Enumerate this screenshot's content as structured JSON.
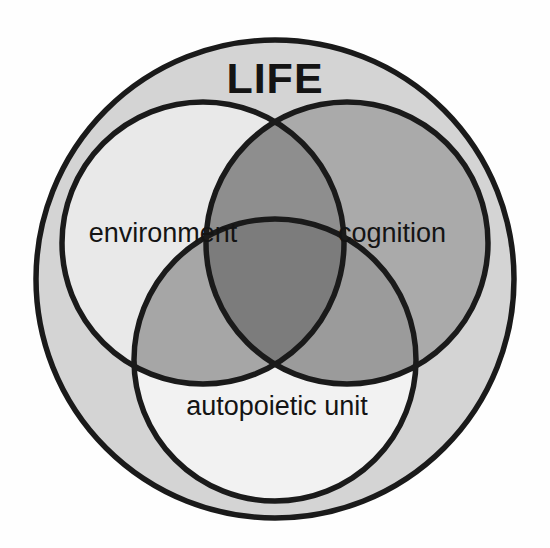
{
  "figure": {
    "type": "venn-diagram",
    "title": "LIFE",
    "background_color": "#fefefe",
    "outline_color": "#1a1a1a",
    "universe": {
      "name": "LIFE",
      "label": "LIFE",
      "fill": "#d4d4d4",
      "cx": 275,
      "cy": 279,
      "r": 239
    },
    "sets": [
      {
        "key": "environment",
        "label": "environment",
        "fill": "#e9e9e9",
        "cx": 203,
        "cy": 243,
        "r": 141,
        "label_x": 163,
        "label_y": 235
      },
      {
        "key": "cognition",
        "label": "cognition",
        "fill": "#aaaaaa",
        "cx": 347,
        "cy": 243,
        "r": 141,
        "label_x": 392,
        "label_y": 235
      },
      {
        "key": "autopoietic_unit",
        "label": "autopoietic unit",
        "fill": "#f2f2f2",
        "cx": 275,
        "cy": 360,
        "r": 141,
        "label_x": 277,
        "label_y": 408
      }
    ],
    "intersections": [
      {
        "key": "environment-cognition",
        "label": "environment ∩ cognition",
        "fill": "#8e8e8e"
      },
      {
        "key": "environment-autopoietic_unit",
        "label": "environment ∩ autopoietic unit",
        "fill": "#a6a6a6"
      },
      {
        "key": "cognition-autopoietic_unit",
        "label": "cognition ∩ autopoietic unit",
        "fill": "#9b9b9b"
      },
      {
        "key": "environment-cognition-autopoietic_unit",
        "label": "environment ∩ cognition ∩ autopoietic unit",
        "fill": "#7c7c7c"
      }
    ]
  }
}
